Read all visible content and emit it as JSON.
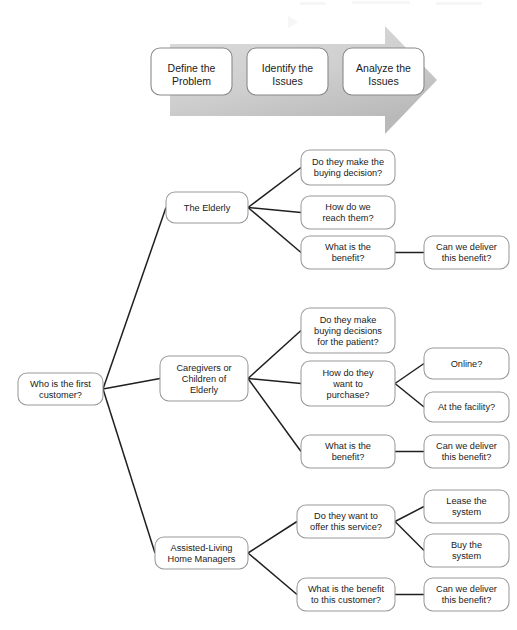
{
  "diagram": {
    "colors": {
      "arrow_light": "#d8d8d8",
      "arrow_dark": "#bcbcbc",
      "box_fill": "#ffffff",
      "box_stroke": "#9a9a9a",
      "connector": "#1f1f1f",
      "text": "#1b1b1b",
      "background": "#ffffff"
    }
  },
  "process": {
    "name": "problem-solving-process-arrow",
    "steps": [
      {
        "id": "define",
        "lines": [
          "Define the",
          "Problem"
        ],
        "x": 151,
        "y": 48,
        "w": 81,
        "h": 47
      },
      {
        "id": "identify",
        "lines": [
          "Identify the",
          "Issues"
        ],
        "x": 247,
        "y": 48,
        "w": 81,
        "h": 47
      },
      {
        "id": "analyze",
        "lines": [
          "Analyze the",
          "Issues"
        ],
        "x": 343,
        "y": 48,
        "w": 81,
        "h": 47
      }
    ]
  },
  "tree": {
    "root": {
      "id": "root",
      "lines": [
        "Who is the first",
        "customer?"
      ],
      "x": 18,
      "y": 373,
      "w": 85,
      "h": 32
    },
    "level2": [
      {
        "id": "elderly",
        "lines": [
          "The Elderly"
        ],
        "x": 166,
        "y": 192,
        "w": 82,
        "h": 31
      },
      {
        "id": "caregivers",
        "lines": [
          "Caregivers or",
          "Children of",
          "Elderly"
        ],
        "x": 160,
        "y": 356,
        "w": 88,
        "h": 45
      },
      {
        "id": "managers",
        "lines": [
          "Assisted-Living",
          "Home Managers"
        ],
        "x": 155,
        "y": 537,
        "w": 93,
        "h": 32
      }
    ],
    "level3": [
      {
        "id": "eld-q1",
        "parent": "elderly",
        "lines": [
          "Do they make the",
          "buying decision?"
        ],
        "x": 301,
        "y": 150,
        "w": 94,
        "h": 35
      },
      {
        "id": "eld-q2",
        "parent": "elderly",
        "lines": [
          "How do we",
          "reach them?"
        ],
        "x": 301,
        "y": 196,
        "w": 94,
        "h": 33
      },
      {
        "id": "eld-q3",
        "parent": "elderly",
        "lines": [
          "What is the",
          "benefit?"
        ],
        "x": 301,
        "y": 236,
        "w": 94,
        "h": 33
      },
      {
        "id": "car-q1",
        "parent": "caregivers",
        "lines": [
          "Do they make",
          "buying decisions",
          "for the patient?"
        ],
        "x": 301,
        "y": 308,
        "w": 94,
        "h": 45
      },
      {
        "id": "car-q2",
        "parent": "caregivers",
        "lines": [
          "How do they",
          "want to",
          "purchase?"
        ],
        "x": 301,
        "y": 361,
        "w": 94,
        "h": 45
      },
      {
        "id": "car-q3",
        "parent": "caregivers",
        "lines": [
          "What is the",
          "benefit?"
        ],
        "x": 301,
        "y": 435,
        "w": 94,
        "h": 33
      },
      {
        "id": "man-q1",
        "parent": "managers",
        "lines": [
          "Do they want to",
          "offer this service?"
        ],
        "x": 297,
        "y": 505,
        "w": 98,
        "h": 33
      },
      {
        "id": "man-q2",
        "parent": "managers",
        "lines": [
          "What is the benefit",
          "to this customer?"
        ],
        "x": 297,
        "y": 578,
        "w": 98,
        "h": 33
      }
    ],
    "level4": [
      {
        "id": "eld-q3-a",
        "parent": "eld-q3",
        "lines": [
          "Can we deliver",
          "this benefit?"
        ],
        "x": 424,
        "y": 236,
        "w": 85,
        "h": 33
      },
      {
        "id": "car-q2-a",
        "parent": "car-q2",
        "lines": [
          "Online?"
        ],
        "x": 424,
        "y": 348,
        "w": 85,
        "h": 31
      },
      {
        "id": "car-q2-b",
        "parent": "car-q2",
        "lines": [
          "At the facility?"
        ],
        "x": 424,
        "y": 392,
        "w": 85,
        "h": 30
      },
      {
        "id": "car-q3-a",
        "parent": "car-q3",
        "lines": [
          "Can we deliver",
          "this benefit?"
        ],
        "x": 424,
        "y": 435,
        "w": 85,
        "h": 33
      },
      {
        "id": "man-q1-a",
        "parent": "man-q1",
        "lines": [
          "Lease the",
          "system"
        ],
        "x": 424,
        "y": 490,
        "w": 85,
        "h": 33
      },
      {
        "id": "man-q1-b",
        "parent": "man-q1",
        "lines": [
          "Buy the",
          "system"
        ],
        "x": 424,
        "y": 534,
        "w": 85,
        "h": 33
      },
      {
        "id": "man-q2-a",
        "parent": "man-q2",
        "lines": [
          "Can we deliver",
          "this benefit?"
        ],
        "x": 424,
        "y": 578,
        "w": 85,
        "h": 33
      }
    ]
  }
}
